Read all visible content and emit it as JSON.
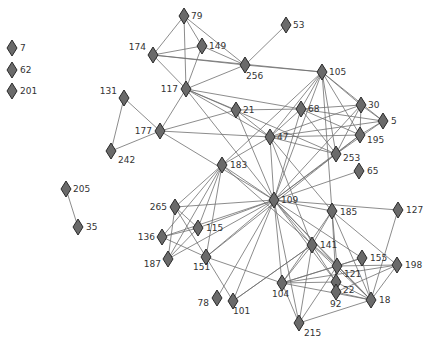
{
  "diagram": {
    "type": "network-graph",
    "node_shape": "diamond",
    "colors": {
      "node_fill": "#6a6a6a",
      "node_stroke": "#2a2a2a",
      "edge": "#6e6e6e",
      "label": "#333333",
      "background": "#ffffff"
    },
    "nodes": [
      {
        "id": "7",
        "x": 12,
        "y": 48,
        "lx": 20,
        "ly": 51,
        "anchor": "start"
      },
      {
        "id": "62",
        "x": 12,
        "y": 70,
        "lx": 20,
        "ly": 73,
        "anchor": "start"
      },
      {
        "id": "201",
        "x": 12,
        "y": 91,
        "lx": 20,
        "ly": 94,
        "anchor": "start"
      },
      {
        "id": "79",
        "x": 184,
        "y": 16,
        "lx": 191,
        "ly": 19,
        "anchor": "start"
      },
      {
        "id": "149",
        "x": 202,
        "y": 46,
        "lx": 209,
        "ly": 49,
        "anchor": "start"
      },
      {
        "id": "174",
        "x": 153,
        "y": 55,
        "lx": 146,
        "ly": 50,
        "anchor": "end"
      },
      {
        "id": "256",
        "x": 245,
        "y": 65,
        "lx": 246,
        "ly": 79,
        "anchor": "start"
      },
      {
        "id": "53",
        "x": 286,
        "y": 25,
        "lx": 293,
        "ly": 28,
        "anchor": "start"
      },
      {
        "id": "117",
        "x": 186,
        "y": 89,
        "lx": 178,
        "ly": 92,
        "anchor": "end"
      },
      {
        "id": "131",
        "x": 124,
        "y": 98,
        "lx": 117,
        "ly": 94,
        "anchor": "end"
      },
      {
        "id": "177",
        "x": 160,
        "y": 131,
        "lx": 152,
        "ly": 134,
        "anchor": "end"
      },
      {
        "id": "242",
        "x": 111,
        "y": 151,
        "lx": 118,
        "ly": 163,
        "anchor": "start"
      },
      {
        "id": "21",
        "x": 236,
        "y": 110,
        "lx": 243,
        "ly": 113,
        "anchor": "start"
      },
      {
        "id": "105",
        "x": 322,
        "y": 72,
        "lx": 329,
        "ly": 75,
        "anchor": "start"
      },
      {
        "id": "68",
        "x": 301,
        "y": 109,
        "lx": 308,
        "ly": 112,
        "anchor": "start"
      },
      {
        "id": "30",
        "x": 361,
        "y": 105,
        "lx": 368,
        "ly": 108,
        "anchor": "start"
      },
      {
        "id": "5",
        "x": 383,
        "y": 121,
        "lx": 391,
        "ly": 124,
        "anchor": "start"
      },
      {
        "id": "195",
        "x": 360,
        "y": 135,
        "lx": 367,
        "ly": 143,
        "anchor": "start"
      },
      {
        "id": "47",
        "x": 270,
        "y": 137,
        "lx": 277,
        "ly": 140,
        "anchor": "start"
      },
      {
        "id": "253",
        "x": 336,
        "y": 154,
        "lx": 343,
        "ly": 161,
        "anchor": "start"
      },
      {
        "id": "65",
        "x": 359,
        "y": 171,
        "lx": 367,
        "ly": 174,
        "anchor": "start"
      },
      {
        "id": "183",
        "x": 222,
        "y": 165,
        "lx": 230,
        "ly": 168,
        "anchor": "start"
      },
      {
        "id": "205",
        "x": 66,
        "y": 189,
        "lx": 73,
        "ly": 192,
        "anchor": "start"
      },
      {
        "id": "35",
        "x": 78,
        "y": 227,
        "lx": 86,
        "ly": 230,
        "anchor": "start"
      },
      {
        "id": "109",
        "x": 274,
        "y": 200,
        "lx": 281,
        "ly": 203,
        "anchor": "start"
      },
      {
        "id": "185",
        "x": 332,
        "y": 211,
        "lx": 340,
        "ly": 215,
        "anchor": "start"
      },
      {
        "id": "127",
        "x": 398,
        "y": 210,
        "lx": 406,
        "ly": 213,
        "anchor": "start"
      },
      {
        "id": "265",
        "x": 175,
        "y": 207,
        "lx": 167,
        "ly": 210,
        "anchor": "end"
      },
      {
        "id": "115",
        "x": 198,
        "y": 228,
        "lx": 206,
        "ly": 231,
        "anchor": "start"
      },
      {
        "id": "136",
        "x": 162,
        "y": 237,
        "lx": 155,
        "ly": 240,
        "anchor": "end"
      },
      {
        "id": "187",
        "x": 168,
        "y": 259,
        "lx": 161,
        "ly": 267,
        "anchor": "end"
      },
      {
        "id": "151",
        "x": 206,
        "y": 257,
        "lx": 193,
        "ly": 270,
        "anchor": "start"
      },
      {
        "id": "141",
        "x": 312,
        "y": 245,
        "lx": 320,
        "ly": 248,
        "anchor": "start"
      },
      {
        "id": "155",
        "x": 362,
        "y": 258,
        "lx": 370,
        "ly": 261,
        "anchor": "start"
      },
      {
        "id": "198",
        "x": 397,
        "y": 265,
        "lx": 405,
        "ly": 268,
        "anchor": "start"
      },
      {
        "id": "121",
        "x": 337,
        "y": 266,
        "lx": 344,
        "ly": 277,
        "anchor": "start"
      },
      {
        "id": "22",
        "x": 336,
        "y": 282,
        "lx": 343,
        "ly": 293,
        "anchor": "start"
      },
      {
        "id": "92",
        "x": 336,
        "y": 292,
        "lx": 330,
        "ly": 307,
        "anchor": "start"
      },
      {
        "id": "18",
        "x": 371,
        "y": 300,
        "lx": 379,
        "ly": 303,
        "anchor": "start"
      },
      {
        "id": "104",
        "x": 282,
        "y": 283,
        "lx": 272,
        "ly": 297,
        "anchor": "start"
      },
      {
        "id": "78",
        "x": 217,
        "y": 298,
        "lx": 209,
        "ly": 306,
        "anchor": "end"
      },
      {
        "id": "101",
        "x": 233,
        "y": 301,
        "lx": 233,
        "ly": 314,
        "anchor": "start"
      },
      {
        "id": "215",
        "x": 299,
        "y": 323,
        "lx": 304,
        "ly": 336,
        "anchor": "start"
      }
    ],
    "edges": [
      [
        "79",
        "174"
      ],
      [
        "79",
        "149"
      ],
      [
        "79",
        "117"
      ],
      [
        "79",
        "256"
      ],
      [
        "174",
        "149"
      ],
      [
        "174",
        "256"
      ],
      [
        "174",
        "117"
      ],
      [
        "149",
        "117"
      ],
      [
        "149",
        "256"
      ],
      [
        "256",
        "117"
      ],
      [
        "256",
        "53"
      ],
      [
        "256",
        "105"
      ],
      [
        "174",
        "105"
      ],
      [
        "117",
        "177"
      ],
      [
        "117",
        "21"
      ],
      [
        "117",
        "47"
      ],
      [
        "117",
        "109"
      ],
      [
        "117",
        "68"
      ],
      [
        "117",
        "253"
      ],
      [
        "131",
        "177"
      ],
      [
        "131",
        "242"
      ],
      [
        "177",
        "242"
      ],
      [
        "177",
        "21"
      ],
      [
        "177",
        "47"
      ],
      [
        "177",
        "109"
      ],
      [
        "21",
        "47"
      ],
      [
        "21",
        "109"
      ],
      [
        "21",
        "68"
      ],
      [
        "105",
        "68"
      ],
      [
        "105",
        "47"
      ],
      [
        "105",
        "30"
      ],
      [
        "105",
        "5"
      ],
      [
        "105",
        "253"
      ],
      [
        "105",
        "109"
      ],
      [
        "105",
        "183"
      ],
      [
        "105",
        "195"
      ],
      [
        "105",
        "185"
      ],
      [
        "68",
        "30"
      ],
      [
        "68",
        "5"
      ],
      [
        "68",
        "195"
      ],
      [
        "68",
        "253"
      ],
      [
        "68",
        "109"
      ],
      [
        "68",
        "47"
      ],
      [
        "30",
        "47"
      ],
      [
        "30",
        "5"
      ],
      [
        "30",
        "195"
      ],
      [
        "30",
        "253"
      ],
      [
        "30",
        "109"
      ],
      [
        "5",
        "47"
      ],
      [
        "5",
        "253"
      ],
      [
        "5",
        "195"
      ],
      [
        "195",
        "47"
      ],
      [
        "195",
        "109"
      ],
      [
        "195",
        "253"
      ],
      [
        "253",
        "47"
      ],
      [
        "253",
        "109"
      ],
      [
        "253",
        "151"
      ],
      [
        "65",
        "109"
      ],
      [
        "47",
        "109"
      ],
      [
        "47",
        "185"
      ],
      [
        "47",
        "141"
      ],
      [
        "47",
        "183"
      ],
      [
        "183",
        "109"
      ],
      [
        "183",
        "265"
      ],
      [
        "183",
        "115"
      ],
      [
        "183",
        "136"
      ],
      [
        "183",
        "187"
      ],
      [
        "183",
        "151"
      ],
      [
        "183",
        "121"
      ],
      [
        "205",
        "35"
      ],
      [
        "109",
        "185"
      ],
      [
        "109",
        "127"
      ],
      [
        "109",
        "265"
      ],
      [
        "109",
        "115"
      ],
      [
        "109",
        "136"
      ],
      [
        "109",
        "187"
      ],
      [
        "109",
        "151"
      ],
      [
        "109",
        "141"
      ],
      [
        "109",
        "155"
      ],
      [
        "109",
        "121"
      ],
      [
        "109",
        "22"
      ],
      [
        "109",
        "18"
      ],
      [
        "109",
        "104"
      ],
      [
        "109",
        "78"
      ],
      [
        "109",
        "101"
      ],
      [
        "109",
        "215"
      ],
      [
        "185",
        "141"
      ],
      [
        "185",
        "121"
      ],
      [
        "185",
        "18"
      ],
      [
        "185",
        "198"
      ],
      [
        "185",
        "104"
      ],
      [
        "185",
        "22"
      ],
      [
        "127",
        "18"
      ],
      [
        "265",
        "115"
      ],
      [
        "265",
        "151"
      ],
      [
        "265",
        "187"
      ],
      [
        "136",
        "151"
      ],
      [
        "136",
        "115"
      ],
      [
        "187",
        "115"
      ],
      [
        "151",
        "101"
      ],
      [
        "151",
        "104"
      ],
      [
        "141",
        "104"
      ],
      [
        "141",
        "22"
      ],
      [
        "141",
        "18"
      ],
      [
        "141",
        "215"
      ],
      [
        "141",
        "101"
      ],
      [
        "155",
        "18"
      ],
      [
        "155",
        "104"
      ],
      [
        "155",
        "121"
      ],
      [
        "198",
        "121"
      ],
      [
        "198",
        "18"
      ],
      [
        "198",
        "104"
      ],
      [
        "198",
        "92"
      ],
      [
        "121",
        "104"
      ],
      [
        "121",
        "215"
      ],
      [
        "121",
        "18"
      ],
      [
        "22",
        "18"
      ],
      [
        "22",
        "104"
      ],
      [
        "92",
        "18"
      ],
      [
        "104",
        "215"
      ],
      [
        "104",
        "18"
      ],
      [
        "215",
        "18"
      ],
      [
        "101",
        "141"
      ]
    ]
  }
}
